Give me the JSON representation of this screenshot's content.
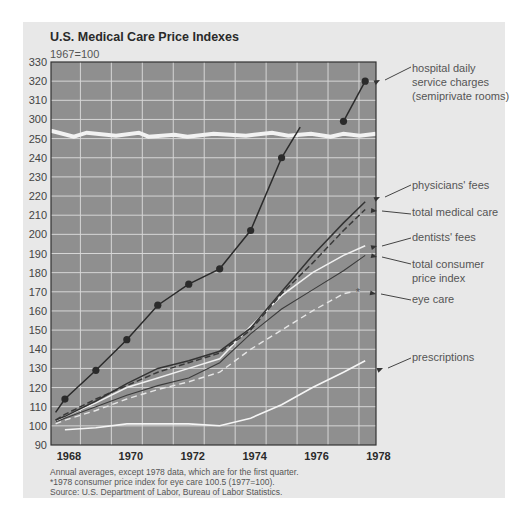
{
  "chart": {
    "title": "U.S. Medical Care Price Indexes",
    "subtitle": "1967=100",
    "notes": [
      "Annual averages, except 1978 data, which are for the first quarter.",
      "*1978 consumer price index for eye care 100.5 (1977=100).",
      "Source: U.S. Department of Labor, Bureau of Labor Statistics."
    ]
  },
  "chart_data": {
    "type": "line",
    "title": "U.S. Medical Care Price Indexes",
    "subtitle": "1967=100",
    "xlabel": "",
    "ylabel": "",
    "x_ticks": [
      "1968",
      "1970",
      "1972",
      "1974",
      "1976",
      "1978"
    ],
    "y_ticks_upper": [
      "330",
      "320",
      "310",
      "300"
    ],
    "y_ticks_lower": [
      "250",
      "240",
      "230",
      "220",
      "210",
      "200",
      "190",
      "180",
      "170",
      "160",
      "150",
      "140",
      "130",
      "120",
      "110",
      "100",
      "90"
    ],
    "ylim": [
      90,
      330
    ],
    "axis_break": [
      250,
      300
    ],
    "grid": true,
    "legend_position": "right (direct labels with arrows)",
    "x": [
      1967.7,
      1968,
      1969,
      1970,
      1971,
      1972,
      1973,
      1974,
      1975,
      1976,
      1977,
      1978
    ],
    "series": [
      {
        "name": "hospital daily service charges (semiprivate rooms)",
        "style": "dark solid with markers",
        "points": [
          [
            1967.7,
            107
          ],
          [
            1968,
            114
          ],
          [
            1969,
            129
          ],
          [
            1970,
            145
          ],
          [
            1971,
            163
          ],
          [
            1972,
            174
          ],
          [
            1973,
            182
          ],
          [
            1974,
            202
          ],
          [
            1975,
            240
          ],
          [
            1975.6,
            256
          ],
          [
            1977,
            299
          ],
          [
            1977.7,
            320
          ]
        ]
      },
      {
        "name": "physicians' fees",
        "style": "dark solid",
        "points": [
          [
            1967.7,
            103
          ],
          [
            1968,
            105
          ],
          [
            1969,
            113
          ],
          [
            1970,
            122
          ],
          [
            1971,
            130
          ],
          [
            1972,
            134
          ],
          [
            1973,
            139
          ],
          [
            1974,
            151
          ],
          [
            1975,
            170
          ],
          [
            1976,
            189
          ],
          [
            1977,
            206
          ],
          [
            1977.7,
            217
          ]
        ]
      },
      {
        "name": "total medical care",
        "style": "dark dashed",
        "points": [
          [
            1967.7,
            103
          ],
          [
            1968,
            106
          ],
          [
            1969,
            114
          ],
          [
            1970,
            121
          ],
          [
            1971,
            128
          ],
          [
            1972,
            133
          ],
          [
            1973,
            138
          ],
          [
            1974,
            150
          ],
          [
            1975,
            169
          ],
          [
            1976,
            185
          ],
          [
            1977,
            202
          ],
          [
            1977.7,
            213
          ]
        ]
      },
      {
        "name": "dentists' fees",
        "style": "white solid",
        "points": [
          [
            1967.7,
            102
          ],
          [
            1968,
            105
          ],
          [
            1969,
            112
          ],
          [
            1970,
            120
          ],
          [
            1971,
            125
          ],
          [
            1972,
            130
          ],
          [
            1973,
            135
          ],
          [
            1974,
            152
          ],
          [
            1975,
            168
          ],
          [
            1976,
            180
          ],
          [
            1977,
            189
          ],
          [
            1977.7,
            194
          ]
        ]
      },
      {
        "name": "total consumer price index",
        "style": "dark solid thin",
        "points": [
          [
            1967.7,
            102
          ],
          [
            1968,
            104
          ],
          [
            1969,
            110
          ],
          [
            1970,
            116
          ],
          [
            1971,
            121
          ],
          [
            1972,
            125
          ],
          [
            1973,
            133
          ],
          [
            1974,
            148
          ],
          [
            1975,
            161
          ],
          [
            1976,
            171
          ],
          [
            1977,
            181
          ],
          [
            1977.7,
            189
          ]
        ]
      },
      {
        "name": "eye care",
        "style": "white dashed",
        "points": [
          [
            1967.7,
            101
          ],
          [
            1968,
            103
          ],
          [
            1969,
            108
          ],
          [
            1970,
            114
          ],
          [
            1971,
            119
          ],
          [
            1972,
            123
          ],
          [
            1973,
            128
          ],
          [
            1974,
            140
          ],
          [
            1975,
            150
          ],
          [
            1976,
            160
          ],
          [
            1977,
            169
          ],
          [
            1977.3,
            170
          ]
        ]
      },
      {
        "name": "prescriptions",
        "style": "white solid",
        "points": [
          [
            1968,
            98
          ],
          [
            1969,
            99
          ],
          [
            1970,
            101
          ],
          [
            1971,
            101
          ],
          [
            1972,
            101
          ],
          [
            1973,
            100
          ],
          [
            1974,
            104
          ],
          [
            1975,
            111
          ],
          [
            1976,
            120
          ],
          [
            1977,
            128
          ],
          [
            1977.7,
            134
          ]
        ]
      }
    ],
    "annotations": [
      "hospital daily service charges (semiprivate rooms)",
      "physicians' fees",
      "total medical care",
      "dentists' fees",
      "total consumer price index",
      "eye care",
      "prescriptions"
    ]
  }
}
